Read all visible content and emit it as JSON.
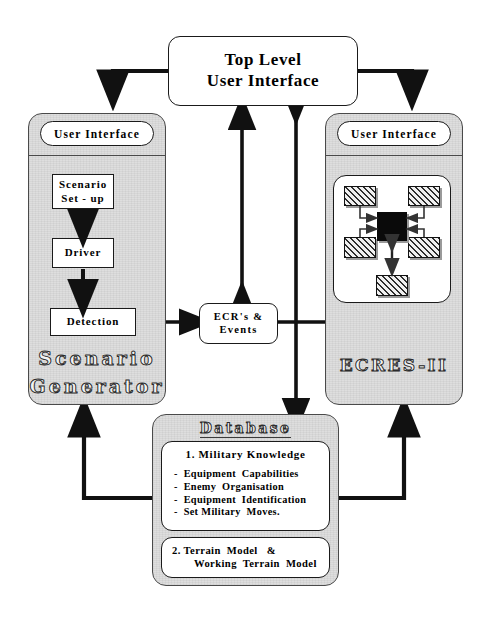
{
  "diagram": {
    "title_box": {
      "line1": "Top  Level",
      "line2": "User   Interface"
    },
    "left_panel": {
      "ui_label": "User   Interface",
      "steps": [
        {
          "line1": "Scenario",
          "line2": "Set - up"
        },
        {
          "line1": "Driver",
          "line2": ""
        },
        {
          "line1": "Detection",
          "line2": ""
        }
      ],
      "name_line1": "Scenario",
      "name_line2": "Generator"
    },
    "center_node": {
      "line1": "ECR's  &",
      "line2": "Events"
    },
    "right_panel": {
      "ui_label": "User   Interface",
      "name": "ECRES-II",
      "inner": {
        "center_node_label": "",
        "boxes": [
          {
            "id": "tl",
            "label": ""
          },
          {
            "id": "tr",
            "label": ""
          },
          {
            "id": "ml",
            "label": ""
          },
          {
            "id": "mr",
            "label": ""
          },
          {
            "id": "bottom",
            "label": ""
          }
        ]
      }
    },
    "database": {
      "header": "Database",
      "section1_title": "1.  Military  Knowledge",
      "section1_items": [
        "-  Equipment  Capabilities",
        "-  Enemy  Organisation",
        "-  Equipment  Identification",
        "-  Set Military  Moves."
      ],
      "section2_line1": "2. Terrain  Model   &",
      "section2_line2": "Working  Terrain  Model"
    },
    "colors": {
      "panel_fill": "#dedede",
      "box_fill": "#ffffff",
      "line": "#111111",
      "hatch_ink": "#2e2e2e",
      "shadow": "#9a9a9a",
      "page_bg": "#ffffff"
    },
    "icons": {
      "arrow": "arrow-head",
      "double_arrow": "double-arrow"
    }
  }
}
